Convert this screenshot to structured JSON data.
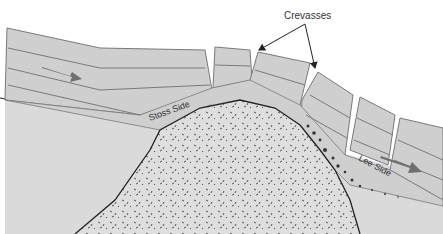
{
  "diagram": {
    "type": "glacier-over-bedrock-knob",
    "labels": {
      "crevasses": "Crevasses",
      "stoss_side": "Stoss Side",
      "lee_side": "Lee Side"
    },
    "colors": {
      "ice": "#cfcfcf",
      "ice_line": "#7a7a7a",
      "ground": "#d8d8d8",
      "bedrock": "#dedede",
      "bedrock_dots": "#555555",
      "outline": "#222222",
      "arrow": "#6f6f6f",
      "text": "#333333",
      "background": "#ffffff"
    },
    "flow_arrows": [
      {
        "name": "flow-arrow-left",
        "direction": "right"
      },
      {
        "name": "flow-arrow-right",
        "direction": "down-right"
      }
    ],
    "crevasse_count": 4
  }
}
